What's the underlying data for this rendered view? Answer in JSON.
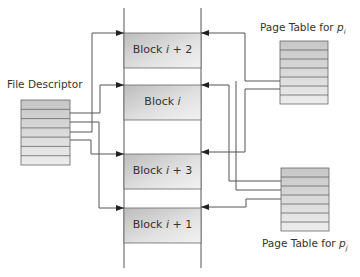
{
  "diagram": {
    "title": "",
    "file_descriptor": {
      "label": "File Descriptor",
      "rows": 7
    },
    "page_table_i": {
      "label_prefix": "Page Table for ",
      "label_var": "p",
      "label_sub": "i",
      "rows": 7
    },
    "page_table_j": {
      "label_prefix": "Page Table for ",
      "label_var": "p",
      "label_sub": "j",
      "rows": 7
    },
    "blocks": [
      {
        "id": "block-i-plus-2",
        "prefix": "Block ",
        "var": "i",
        "suffix": " + 2"
      },
      {
        "id": "block-i",
        "prefix": "Block ",
        "var": "i",
        "suffix": ""
      },
      {
        "id": "block-i-plus-3",
        "prefix": "Block ",
        "var": "i",
        "suffix": " + 3"
      },
      {
        "id": "block-i-plus-1",
        "prefix": "Block ",
        "var": "i",
        "suffix": " + 1"
      }
    ],
    "colors": {
      "line": "#555555",
      "box_fill_top": "#e4e4e4",
      "box_fill_bottom": "#c8c8c8",
      "text": "#333333"
    }
  }
}
